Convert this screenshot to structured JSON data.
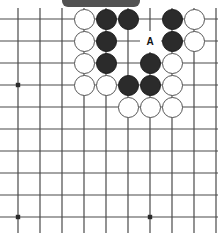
{
  "figure": {
    "kind": "go-board-diagram",
    "board": {
      "cols": 10,
      "rows": 11,
      "origin_x": 18,
      "origin_y": 19,
      "spacing": 22,
      "line_color": "#4a4a4a",
      "background_color": "#ffffff",
      "star_points": [
        {
          "col": 0,
          "row": 3
        },
        {
          "col": 0,
          "row": 9
        },
        {
          "col": 6,
          "row": 9
        }
      ]
    },
    "stone_colors": {
      "black": "#2b2b2b",
      "white": "#ffffff",
      "white_outline": "#555555"
    },
    "stones": [
      {
        "col": 3,
        "row": 0,
        "color": "white"
      },
      {
        "col": 4,
        "row": 0,
        "color": "black"
      },
      {
        "col": 5,
        "row": 0,
        "color": "black"
      },
      {
        "col": 7,
        "row": 0,
        "color": "black"
      },
      {
        "col": 8,
        "row": 0,
        "color": "white"
      },
      {
        "col": 3,
        "row": 1,
        "color": "white"
      },
      {
        "col": 4,
        "row": 1,
        "color": "black"
      },
      {
        "col": 7,
        "row": 1,
        "color": "black"
      },
      {
        "col": 8,
        "row": 1,
        "color": "white"
      },
      {
        "col": 3,
        "row": 2,
        "color": "white"
      },
      {
        "col": 4,
        "row": 2,
        "color": "black"
      },
      {
        "col": 6,
        "row": 2,
        "color": "black"
      },
      {
        "col": 7,
        "row": 2,
        "color": "white"
      },
      {
        "col": 3,
        "row": 3,
        "color": "white"
      },
      {
        "col": 4,
        "row": 3,
        "color": "white"
      },
      {
        "col": 5,
        "row": 3,
        "color": "black"
      },
      {
        "col": 6,
        "row": 3,
        "color": "black"
      },
      {
        "col": 7,
        "row": 3,
        "color": "white"
      },
      {
        "col": 5,
        "row": 4,
        "color": "white"
      },
      {
        "col": 6,
        "row": 4,
        "color": "white"
      },
      {
        "col": 7,
        "row": 4,
        "color": "white"
      }
    ],
    "markers": [
      {
        "col": 6,
        "row": 1,
        "label": "A"
      }
    ],
    "artifact": {
      "name": "scan-shadow-bar",
      "present": true
    }
  }
}
